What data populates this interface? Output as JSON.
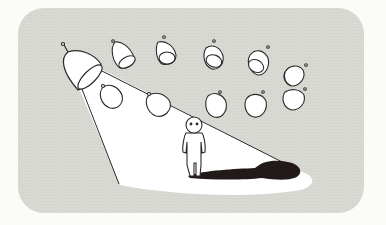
{
  "illustration": {
    "description": "Spotlight shining on a lone small figure among many hanging lamps",
    "colors": {
      "page_background": "#fbfbf7",
      "panel": "#d9d9d3",
      "light": "#ffffff",
      "outline": "#2a2a2a",
      "shadow": "#221a18"
    },
    "elements": {
      "main_lamp": "spotlight-lamp",
      "unlit_lamps_count": 10,
      "figure": "person",
      "shadow": "person-shadow"
    }
  }
}
